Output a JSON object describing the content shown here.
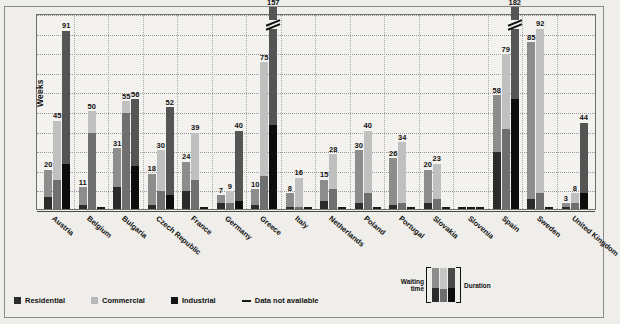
{
  "chart_data": {
    "type": "bar",
    "title": "",
    "subtitle": "",
    "xlabel": "",
    "ylabel": "Weeks",
    "ylim": [
      0,
      100
    ],
    "ytick_step": 10,
    "yticks": [
      0,
      10,
      20,
      30,
      40,
      50,
      60,
      70,
      80,
      90,
      100
    ],
    "grid": true,
    "legend_position": "bottom-left",
    "stacked_note": "Each bar is split into a dark lower segment (waiting time) and a lighter upper segment (duration); the printed number is the bar total.",
    "categories": [
      "Austria",
      "Belgium",
      "Bulgaria",
      "Czech Republic",
      "France",
      "Germany",
      "Greece",
      "Italy",
      "Netherlands",
      "Poland",
      "Portugal",
      "Slovakia",
      "Slovenia",
      "Spain",
      "Sweden",
      "United Kingdom"
    ],
    "series": [
      {
        "name": "Residential",
        "color": "#2b2b2b",
        "values": [
          20,
          11,
          31,
          18,
          24,
          7,
          10,
          8,
          15,
          30,
          26,
          20,
          null,
          58,
          85,
          3
        ],
        "waiting": [
          6,
          2,
          11,
          2,
          9,
          3,
          2,
          1,
          4,
          3,
          2,
          3,
          null,
          29,
          5,
          1
        ]
      },
      {
        "name": "Commercial",
        "color": "#c0c0c0",
        "values": [
          45,
          50,
          55,
          30,
          39,
          9,
          75,
          16,
          28,
          40,
          34,
          23,
          null,
          79,
          92,
          8
        ],
        "waiting": [
          15,
          39,
          49,
          9,
          15,
          3,
          17,
          1,
          10,
          8,
          3,
          5,
          null,
          41,
          8,
          3
        ]
      },
      {
        "name": "Industrial",
        "color": "#141414",
        "values": [
          91,
          null,
          56,
          52,
          null,
          40,
          157,
          null,
          null,
          null,
          null,
          null,
          null,
          182,
          null,
          44
        ],
        "waiting": [
          23,
          null,
          22,
          7,
          null,
          4,
          43,
          null,
          null,
          null,
          null,
          null,
          null,
          56,
          null,
          8
        ]
      }
    ],
    "value_labels": {
      "Austria": [
        "20",
        "45",
        "91"
      ],
      "Belgium": [
        "11",
        "50",
        ""
      ],
      "Bulgaria": [
        "31",
        "55",
        "56"
      ],
      "Czech Republic": [
        "18",
        "30",
        "52"
      ],
      "France": [
        "24",
        "39",
        ""
      ],
      "Germany": [
        "7",
        "9",
        "40"
      ],
      "Greece": [
        "10",
        "75",
        "157"
      ],
      "Italy": [
        "8",
        "16",
        ""
      ],
      "Netherlands": [
        "15",
        "28",
        ""
      ],
      "Poland": [
        "30",
        "40",
        ""
      ],
      "Portugal": [
        "26",
        "34",
        ""
      ],
      "Slovakia": [
        "20",
        "23",
        ""
      ],
      "Slovenia": [
        "",
        "",
        ""
      ],
      "Spain": [
        "58",
        "79",
        "182"
      ],
      "Sweden": [
        "85",
        "92",
        ""
      ],
      "United Kingdom": [
        "3",
        "8",
        "44"
      ]
    },
    "off_scale_bars": [
      {
        "category": "Greece",
        "series": "Industrial",
        "value": 157
      },
      {
        "category": "Spain",
        "series": "Industrial",
        "value": 182
      }
    ]
  },
  "legend": {
    "items": [
      {
        "label": "Residential",
        "swatch": "res"
      },
      {
        "label": "Commercial",
        "swatch": "com"
      },
      {
        "label": "Industrial",
        "swatch": "ind"
      },
      {
        "label": "Data not available",
        "swatch": "na"
      }
    ]
  },
  "bracket_legend": {
    "waiting_line1": "Waiting",
    "waiting_line2": "time",
    "duration": "Duration"
  }
}
